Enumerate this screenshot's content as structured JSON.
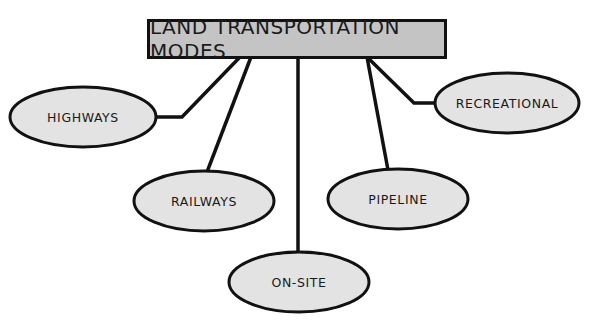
{
  "diagram": {
    "title": "LAND TRANSPORTATION MODES",
    "colors": {
      "title_fill": "#c4c4c4",
      "node_fill": "#e3e3e3",
      "stroke": "#111111",
      "background": "#ffffff"
    },
    "nodes": [
      {
        "id": "highways",
        "label": "HIGHWAYS",
        "cx": 83,
        "cy": 117,
        "rx": 73,
        "ry": 30
      },
      {
        "id": "railways",
        "label": "RAILWAYS",
        "cx": 204,
        "cy": 201,
        "rx": 70,
        "ry": 30
      },
      {
        "id": "on-site",
        "label": "ON-SITE",
        "cx": 299,
        "cy": 282,
        "rx": 70,
        "ry": 30
      },
      {
        "id": "pipeline",
        "label": "PIPELINE",
        "cx": 398,
        "cy": 199,
        "rx": 70,
        "ry": 30
      },
      {
        "id": "recreational",
        "label": "RECREATIONAL",
        "cx": 507,
        "cy": 103,
        "rx": 72,
        "ry": 30
      }
    ],
    "edges": [
      {
        "from": "title",
        "to": "highways",
        "points": "240,57 182,117 156,117"
      },
      {
        "from": "title",
        "to": "railways",
        "points": "251,57 207,172"
      },
      {
        "from": "title",
        "to": "on-site",
        "points": "298,57 298,252"
      },
      {
        "from": "title",
        "to": "pipeline",
        "points": "367,57 388,170"
      },
      {
        "from": "title",
        "to": "recreational",
        "points": "367,57 414,103 435,103"
      }
    ]
  }
}
